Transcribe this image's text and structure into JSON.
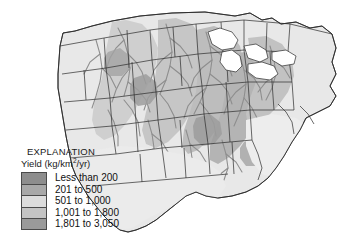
{
  "figure": {
    "name": "yield-choropleth-map",
    "background_color": "#ffffff",
    "region_description": "Central and eastern United States"
  },
  "legend": {
    "title": "EXPLANATION",
    "subtitle_prefix": "Yield (kg/km",
    "subtitle_sup": "2",
    "subtitle_suffix": "/yr)",
    "items": [
      {
        "label": "Less than 200",
        "color": "#8d8d8d"
      },
      {
        "label": "201 to 500",
        "color": "#a8a8a8"
      },
      {
        "label": "501 to 1,000",
        "color": "#dcdcdc"
      },
      {
        "label": "1,001 to 1,800",
        "color": "#c4c4c4"
      },
      {
        "label": "1,801 to 3,050",
        "color": "#9a9a9a"
      }
    ]
  },
  "chart_data": {
    "type": "heatmap",
    "title": "Yield (kg/km2/yr)",
    "subtitle": "EXPLANATION",
    "xlabel": "",
    "ylabel": "",
    "legend_position": "lower-left",
    "grid": false,
    "categories": [
      "Less than 200",
      "201 to 500",
      "501 to 1,000",
      "1,001 to 1,800",
      "1,801 to 3,050"
    ],
    "class_breaks": [
      0,
      200,
      500,
      1000,
      1800,
      3050
    ],
    "colors": [
      "#8d8d8d",
      "#a8a8a8",
      "#dcdcdc",
      "#c4c4c4",
      "#9a9a9a"
    ],
    "units": "kg/km2/yr",
    "map_colors": {
      "base_fill": "#e6e6e6",
      "mid_fill": "#c9c9c9",
      "dark_fill": "#a5a5a5",
      "outline": "#2b2b2b",
      "water": "#ffffff"
    }
  }
}
